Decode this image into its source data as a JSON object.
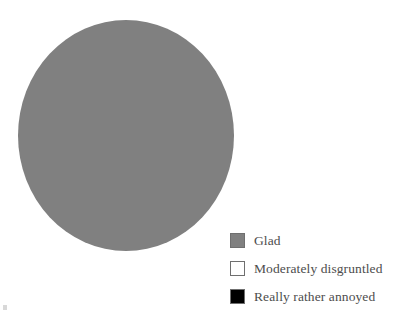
{
  "chart_data": {
    "type": "pie",
    "title": "",
    "categories": [
      "Glad",
      "Moderately disgruntled",
      "Really rather annoyed"
    ],
    "values": [
      100,
      0,
      0
    ],
    "colors": [
      "#808080",
      "#ffffff",
      "#000000"
    ],
    "legend_position": "right-bottom",
    "grid": false,
    "labels_shown": false,
    "annotations": []
  },
  "legend": {
    "items": [
      {
        "label": "Glad",
        "color": "#808080",
        "swatch_name": "legend-swatch-glad"
      },
      {
        "label": "Moderately disgruntled",
        "color": "#ffffff",
        "swatch_name": "legend-swatch-moderately-disgruntled"
      },
      {
        "label": "Really rather annoyed",
        "color": "#000000",
        "swatch_name": "legend-swatch-really-rather-annoyed"
      }
    ]
  },
  "pie": {
    "slices": [
      {
        "label": "Glad",
        "percent": 100,
        "color": "#808080"
      }
    ]
  }
}
